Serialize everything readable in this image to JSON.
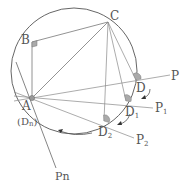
{
  "diagram": {
    "colors": {
      "stroke": "#555555",
      "light_stroke": "#888888",
      "marker": "#999999",
      "text": "#555555"
    },
    "circle": {
      "cx": 74,
      "cy": 71,
      "r": 63
    },
    "points": {
      "A": {
        "label": "A",
        "x": 32,
        "y": 98
      },
      "An": {
        "label": "(Dn)",
        "x": 32,
        "y": 98
      },
      "B": {
        "label": "B",
        "x": 32,
        "y": 42
      },
      "C": {
        "label": "C",
        "x": 108,
        "y": 22
      },
      "D": {
        "label": "D",
        "x": 136,
        "y": 80
      },
      "D1": {
        "label": "D1",
        "x": 126,
        "y": 101
      },
      "D2": {
        "label": "D2",
        "x": 104,
        "y": 121
      },
      "P": {
        "label": "P",
        "x": 173,
        "y": 74
      },
      "P1": {
        "label": "P1",
        "x": 155,
        "y": 108
      },
      "P2": {
        "label": "P2",
        "x": 136,
        "y": 140
      },
      "Pn": {
        "label": "Pn",
        "x": 57,
        "y": 174
      }
    },
    "labels": {
      "A": "A",
      "Dn": "(D",
      "Dn_sub": "n",
      "Dn_close": ")",
      "B": "B",
      "C": "C",
      "D": "D",
      "D1": "D",
      "D1_sub": "1",
      "D2": "D",
      "D2_sub": "2",
      "P": "P",
      "P1": "P",
      "P1_sub": "1",
      "P2": "P",
      "P2_sub": "2",
      "Pn": "Pn"
    }
  }
}
